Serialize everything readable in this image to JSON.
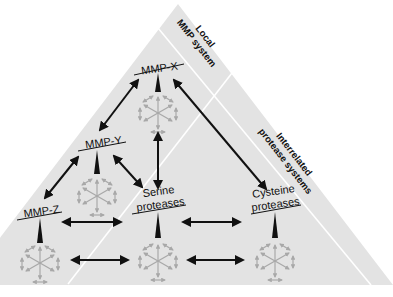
{
  "diagram": {
    "type": "protease network triangle",
    "colors": {
      "background": "#ffffff",
      "triangle_fill": "#e3e3e3",
      "band_divider": "#ffffff",
      "arrow_black": "#111111",
      "network_grey": "#a8a8a8"
    },
    "bands": [
      {
        "id": "local",
        "label_line1": "Local",
        "label_line2": "MMP system"
      },
      {
        "id": "interrelated",
        "label_line1": "Interrelated",
        "label_line2": "protease systems"
      }
    ],
    "nodes": [
      {
        "id": "mmp-x",
        "label": "MMP-X"
      },
      {
        "id": "mmp-y",
        "label": "MMP-Y"
      },
      {
        "id": "mmp-z",
        "label": "MMP-Z"
      },
      {
        "id": "serine",
        "label_line1": "Serine",
        "label_line2": "proteases"
      },
      {
        "id": "cysteine",
        "label_line1": "Cysteine",
        "label_line2": "proteases"
      }
    ],
    "edges": [
      {
        "from": "mmp-x",
        "to": "mmp-y",
        "type": "bidirectional"
      },
      {
        "from": "mmp-x",
        "to": "cysteine",
        "type": "bidirectional"
      },
      {
        "from": "mmp-x",
        "to": "serine",
        "type": "bidirectional"
      },
      {
        "from": "mmp-y",
        "to": "mmp-z",
        "type": "bidirectional"
      },
      {
        "from": "mmp-y",
        "to": "serine",
        "type": "bidirectional"
      },
      {
        "from": "mmp-z",
        "to": "serine",
        "type": "bidirectional"
      },
      {
        "from": "serine",
        "to": "cysteine",
        "type": "bidirectional"
      },
      {
        "from": "mmp-z-network",
        "to": "serine-network",
        "type": "bidirectional"
      },
      {
        "from": "serine-network",
        "to": "cysteine-network",
        "type": "bidirectional"
      }
    ],
    "icons": [
      "network-icon"
    ]
  }
}
